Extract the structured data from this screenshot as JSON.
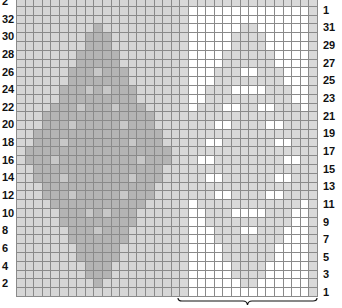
{
  "chart": {
    "type": "knitting-chart",
    "columns": 35,
    "rows": 34,
    "sections": [
      {
        "name": "left-panel",
        "start_col": 0,
        "end_col": 18,
        "background": "L",
        "motif": "D",
        "motif_inner": "K",
        "center_col": 9
      },
      {
        "name": "right-panel-repeat",
        "start_col": 19,
        "end_col": 34,
        "background": "W",
        "motif": "G",
        "motif_inner": "W",
        "center_col": 26.5,
        "edge": "G"
      }
    ],
    "diamond_half_widths_by_row_from_top": [
      -1,
      -1,
      -1,
      0,
      1,
      1,
      2,
      2,
      3,
      3,
      4,
      4,
      5,
      6,
      6,
      7,
      7,
      8,
      8,
      7,
      7,
      6,
      6,
      5,
      4,
      4,
      3,
      3,
      2,
      2,
      1,
      1,
      0,
      -1
    ],
    "colors": {
      "L": "#d6d6d6",
      "D": "#b4b4b4",
      "K": "#c8c8c8",
      "W": "#ffffff",
      "G": "#d9d9d9",
      "gridline": "#8a8a8a"
    }
  },
  "left_labels": [
    "2",
    "32",
    "30",
    "28",
    "26",
    "24",
    "22",
    "20",
    "18",
    "16",
    "14",
    "12",
    "10",
    "8",
    "6",
    "4",
    "2"
  ],
  "right_labels": [
    "1",
    "31",
    "29",
    "27",
    "25",
    "23",
    "21",
    "19",
    "17",
    "15",
    "13",
    "11",
    "9",
    "7",
    "5",
    "3",
    "1"
  ],
  "bracket": {
    "label": "",
    "spans": "right-panel-repeat"
  }
}
